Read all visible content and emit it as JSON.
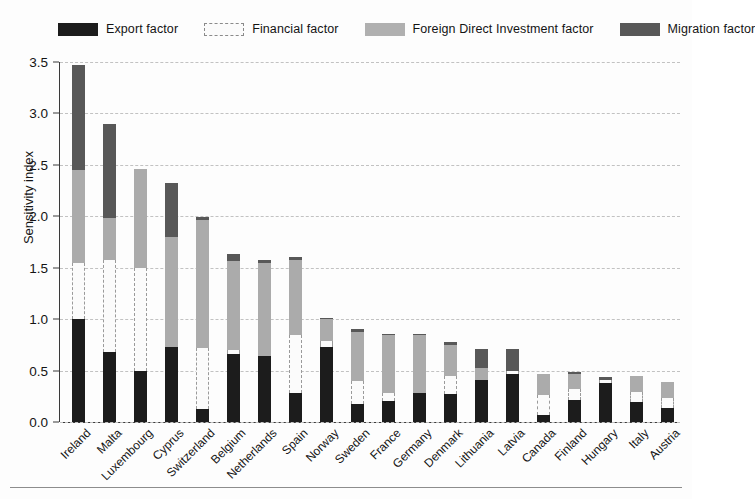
{
  "legend": {
    "position": "top",
    "items": [
      {
        "label": "Export factor",
        "key": "export",
        "color": "#1c1c1c",
        "swatch": "solid-black"
      },
      {
        "label": "Financial factor",
        "key": "financial",
        "color": "#fbfbfb",
        "swatch": "white-dashed"
      },
      {
        "label": "Foreign Direct Investment factor",
        "key": "fdi",
        "color": "#ababab",
        "swatch": "solid-light-gray"
      },
      {
        "label": "Migration factor",
        "key": "migration",
        "color": "#585858",
        "swatch": "solid-dark-gray"
      }
    ]
  },
  "axes": {
    "ylabel": "Sensitivity index",
    "xlabel": "",
    "yticks": [
      "0.0",
      "0.5",
      "1.0",
      "1.5",
      "2.0",
      "2.5",
      "3.0",
      "3.5"
    ],
    "ytick_values": [
      0.0,
      0.5,
      1.0,
      1.5,
      2.0,
      2.5,
      3.0,
      3.5
    ],
    "ylim": [
      0.0,
      3.5
    ],
    "grid": "horizontal-dashed"
  },
  "chart_data": {
    "type": "bar",
    "subtype": "stacked",
    "title": "",
    "xlabel": "",
    "ylabel": "Sensitivity index",
    "ylim": [
      0.0,
      3.5
    ],
    "grid": true,
    "legend_position": "top",
    "categories": [
      "Ireland",
      "Malta",
      "Luxembourg",
      "Cyprus",
      "Switzerland",
      "Belgium",
      "Netherlands",
      "Spain",
      "Norway",
      "Sweden",
      "France",
      "Germany",
      "Denmark",
      "Lithuania",
      "Latvia",
      "Canada",
      "Finland",
      "Hungary",
      "Italy",
      "Austria"
    ],
    "series": [
      {
        "name": "Export factor",
        "color": "#1c1c1c",
        "values": [
          1.0,
          0.68,
          0.5,
          0.73,
          0.13,
          0.66,
          0.64,
          0.28,
          0.73,
          0.18,
          0.2,
          0.28,
          0.27,
          0.41,
          0.47,
          0.07,
          0.21,
          0.38,
          0.19,
          0.14
        ]
      },
      {
        "name": "Financial factor",
        "color": "#fbfbfb",
        "values": [
          0.55,
          0.9,
          1.0,
          0.0,
          0.59,
          0.04,
          0.0,
          0.57,
          0.06,
          0.22,
          0.08,
          0.0,
          0.18,
          0.0,
          0.03,
          0.19,
          0.11,
          0.03,
          0.1,
          0.09
        ]
      },
      {
        "name": "Foreign Direct Investment factor",
        "color": "#ababab",
        "values": [
          0.9,
          0.4,
          0.96,
          1.07,
          1.24,
          0.87,
          0.91,
          0.73,
          0.21,
          0.48,
          0.57,
          0.57,
          0.3,
          0.12,
          0.0,
          0.21,
          0.15,
          0.0,
          0.16,
          0.16
        ]
      },
      {
        "name": "Migration factor",
        "color": "#585858",
        "values": [
          1.02,
          0.92,
          0.0,
          0.52,
          0.03,
          0.06,
          0.03,
          0.02,
          0.01,
          0.02,
          0.01,
          0.01,
          0.03,
          0.18,
          0.21,
          0.0,
          0.02,
          0.03,
          0.0,
          0.0
        ]
      }
    ],
    "totals": [
      3.47,
      2.9,
      2.46,
      2.32,
      1.99,
      1.63,
      1.58,
      1.6,
      1.01,
      0.9,
      0.86,
      0.86,
      0.78,
      0.71,
      0.71,
      0.47,
      0.49,
      0.44,
      0.45,
      0.39
    ]
  }
}
